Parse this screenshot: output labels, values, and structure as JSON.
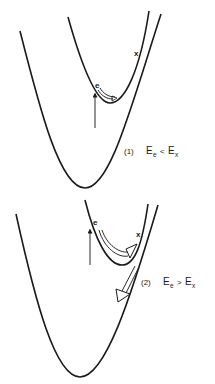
{
  "panels": [
    {
      "id": "panel-1",
      "electron_label": "e",
      "crossing_label": "x",
      "caption": {
        "number": "(1)",
        "lhs": "E",
        "lhs_sub": "e",
        "relation": "<",
        "rhs": "E",
        "rhs_sub": "x"
      }
    },
    {
      "id": "panel-2",
      "electron_label": "e",
      "crossing_label": "x",
      "caption": {
        "number": "(2)",
        "lhs": "E",
        "lhs_sub": "e",
        "relation": ">",
        "rhs": "E",
        "rhs_sub": "x"
      }
    }
  ],
  "colors": {
    "stroke": "#1a1a1a",
    "background": "#ffffff"
  }
}
